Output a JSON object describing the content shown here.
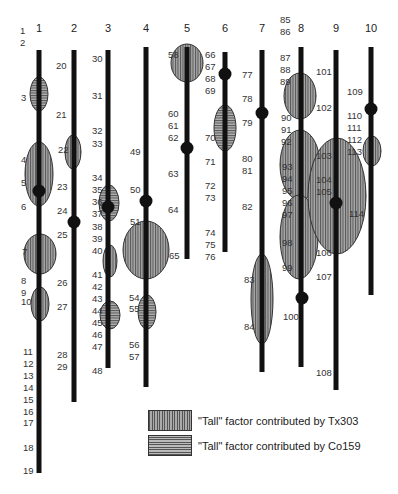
{
  "figure": {
    "type": "genetic-linkage-map",
    "colors": {
      "chromosome": "#111111",
      "ellipse_fill": "#9a9a9a",
      "tx303_stripe": "#555555",
      "co159_stripe": "#555555"
    }
  },
  "chromosomes": [
    {
      "id": "1",
      "x": 39,
      "top": 50,
      "bottom": 473,
      "markers": [
        {
          "label": "1",
          "x": 20,
          "y": 31
        },
        {
          "label": "2",
          "x": 20,
          "y": 43
        },
        {
          "label": "3",
          "x": 21,
          "y": 98
        },
        {
          "label": "4",
          "x": 21,
          "y": 160
        },
        {
          "label": "5",
          "x": 21,
          "y": 183
        },
        {
          "label": "6",
          "x": 21,
          "y": 207
        },
        {
          "label": "7",
          "x": 22,
          "y": 252
        },
        {
          "label": "8",
          "x": 21,
          "y": 281
        },
        {
          "label": "9",
          "x": 21,
          "y": 293
        },
        {
          "label": "10",
          "x": 21,
          "y": 302
        },
        {
          "label": "11",
          "x": 23,
          "y": 352
        },
        {
          "label": "12",
          "x": 23,
          "y": 364
        },
        {
          "label": "13",
          "x": 23,
          "y": 376
        },
        {
          "label": "14",
          "x": 23,
          "y": 388
        },
        {
          "label": "15",
          "x": 23,
          "y": 400
        },
        {
          "label": "16",
          "x": 23,
          "y": 412
        },
        {
          "label": "17",
          "x": 23,
          "y": 423
        },
        {
          "label": "18",
          "x": 23,
          "y": 448
        },
        {
          "label": "19",
          "x": 23,
          "y": 471
        }
      ],
      "qtls": [
        {
          "cx": 39,
          "cy": 94,
          "rx": 9,
          "ry": 17,
          "factor": "Co159"
        },
        {
          "cx": 39,
          "cy": 174,
          "rx": 14,
          "ry": 32,
          "factor": "Tx303"
        },
        {
          "cx": 40,
          "cy": 254,
          "rx": 16,
          "ry": 20,
          "factor": "Tx303"
        },
        {
          "cx": 40,
          "cy": 304,
          "rx": 9,
          "ry": 17,
          "factor": "Tx303"
        }
      ],
      "dots": [
        {
          "cx": 39,
          "cy": 191
        }
      ]
    },
    {
      "id": "2",
      "x": 74,
      "top": 50,
      "bottom": 402,
      "markers": [
        {
          "label": "20",
          "x": 56,
          "y": 66
        },
        {
          "label": "21",
          "x": 56,
          "y": 115
        },
        {
          "label": "22",
          "x": 58,
          "y": 150
        },
        {
          "label": "23",
          "x": 57,
          "y": 187
        },
        {
          "label": "24",
          "x": 57,
          "y": 211
        },
        {
          "label": "25",
          "x": 57,
          "y": 235
        },
        {
          "label": "26",
          "x": 57,
          "y": 283
        },
        {
          "label": "27",
          "x": 57,
          "y": 307
        },
        {
          "label": "28",
          "x": 57,
          "y": 355
        },
        {
          "label": "29",
          "x": 57,
          "y": 367
        }
      ],
      "qtls": [
        {
          "cx": 73,
          "cy": 152,
          "rx": 8,
          "ry": 17,
          "factor": "Tx303"
        }
      ],
      "dots": [
        {
          "cx": 74,
          "cy": 222
        }
      ]
    },
    {
      "id": "3",
      "x": 108,
      "top": 50,
      "bottom": 368,
      "markers": [
        {
          "label": "30",
          "x": 92,
          "y": 59
        },
        {
          "label": "31",
          "x": 92,
          "y": 96
        },
        {
          "label": "32",
          "x": 92,
          "y": 131
        },
        {
          "label": "33",
          "x": 92,
          "y": 144
        },
        {
          "label": "34",
          "x": 92,
          "y": 178
        },
        {
          "label": "35",
          "x": 92,
          "y": 190
        },
        {
          "label": "36",
          "x": 92,
          "y": 202
        },
        {
          "label": "37",
          "x": 92,
          "y": 214
        },
        {
          "label": "38",
          "x": 92,
          "y": 227
        },
        {
          "label": "39",
          "x": 92,
          "y": 239
        },
        {
          "label": "40",
          "x": 92,
          "y": 251
        },
        {
          "label": "41",
          "x": 92,
          "y": 275
        },
        {
          "label": "42",
          "x": 92,
          "y": 287
        },
        {
          "label": "43",
          "x": 92,
          "y": 299
        },
        {
          "label": "44",
          "x": 92,
          "y": 311
        },
        {
          "label": "45",
          "x": 92,
          "y": 323
        },
        {
          "label": "46",
          "x": 92,
          "y": 335
        },
        {
          "label": "47",
          "x": 92,
          "y": 347
        },
        {
          "label": "48",
          "x": 92,
          "y": 371
        }
      ],
      "qtls": [
        {
          "cx": 109,
          "cy": 203,
          "rx": 10,
          "ry": 18,
          "factor": "Co159"
        },
        {
          "cx": 110,
          "cy": 261,
          "rx": 7,
          "ry": 16,
          "factor": "Tx303"
        },
        {
          "cx": 110,
          "cy": 315,
          "rx": 10,
          "ry": 14,
          "factor": "Co159"
        }
      ],
      "dots": [
        {
          "cx": 108,
          "cy": 207
        }
      ]
    },
    {
      "id": "4",
      "x": 146,
      "top": 47,
      "bottom": 387,
      "markers": [
        {
          "label": "49",
          "x": 130,
          "y": 152
        },
        {
          "label": "50",
          "x": 130,
          "y": 190
        },
        {
          "label": "51",
          "x": 130,
          "y": 222
        },
        {
          "label": "54",
          "x": 129,
          "y": 298
        },
        {
          "label": "55",
          "x": 129,
          "y": 309
        },
        {
          "label": "56",
          "x": 129,
          "y": 345
        },
        {
          "label": "57",
          "x": 129,
          "y": 357
        }
      ],
      "qtls": [
        {
          "cx": 146,
          "cy": 250,
          "rx": 23,
          "ry": 29,
          "factor": "Tx303"
        },
        {
          "cx": 147,
          "cy": 312,
          "rx": 9,
          "ry": 17,
          "factor": "Co159"
        }
      ],
      "dots": [
        {
          "cx": 146,
          "cy": 201
        }
      ]
    },
    {
      "id": "5",
      "x": 187,
      "top": 47,
      "bottom": 259,
      "markers": [
        {
          "label": "58",
          "x": 168,
          "y": 55
        },
        {
          "label": "60",
          "x": 168,
          "y": 114
        },
        {
          "label": "61",
          "x": 168,
          "y": 126
        },
        {
          "label": "62",
          "x": 168,
          "y": 138
        },
        {
          "label": "63",
          "x": 168,
          "y": 174
        },
        {
          "label": "64",
          "x": 168,
          "y": 210
        },
        {
          "label": "65",
          "x": 169,
          "y": 256
        }
      ],
      "qtls": [
        {
          "cx": 187,
          "cy": 63,
          "rx": 16,
          "ry": 19,
          "factor": "Tx303"
        }
      ],
      "dots": [
        {
          "cx": 187,
          "cy": 148
        }
      ]
    },
    {
      "id": "6",
      "x": 225,
      "top": 52,
      "bottom": 252,
      "markers": [
        {
          "label": "66",
          "x": 205,
          "y": 55
        },
        {
          "label": "67",
          "x": 205,
          "y": 67
        },
        {
          "label": "68",
          "x": 205,
          "y": 79
        },
        {
          "label": "69",
          "x": 205,
          "y": 91
        },
        {
          "label": "70",
          "x": 205,
          "y": 138
        },
        {
          "label": "71",
          "x": 205,
          "y": 162
        },
        {
          "label": "72",
          "x": 205,
          "y": 186
        },
        {
          "label": "73",
          "x": 205,
          "y": 198
        },
        {
          "label": "74",
          "x": 205,
          "y": 233
        },
        {
          "label": "75",
          "x": 205,
          "y": 245
        },
        {
          "label": "76",
          "x": 205,
          "y": 257
        }
      ],
      "qtls": [
        {
          "cx": 225,
          "cy": 128,
          "rx": 11,
          "ry": 23,
          "factor": "Co159"
        }
      ],
      "dots": [
        {
          "cx": 225,
          "cy": 74
        }
      ]
    },
    {
      "id": "7",
      "x": 262,
      "top": 50,
      "bottom": 372,
      "markers": [
        {
          "label": "77",
          "x": 242,
          "y": 75
        },
        {
          "label": "78",
          "x": 242,
          "y": 99
        },
        {
          "label": "79",
          "x": 242,
          "y": 123
        },
        {
          "label": "80",
          "x": 242,
          "y": 159
        },
        {
          "label": "81",
          "x": 242,
          "y": 171
        },
        {
          "label": "82",
          "x": 242,
          "y": 207
        },
        {
          "label": "83",
          "x": 244,
          "y": 280
        },
        {
          "label": "84",
          "x": 244,
          "y": 327
        }
      ],
      "qtls": [
        {
          "cx": 262,
          "cy": 299,
          "rx": 11,
          "ry": 45,
          "factor": "Tx303"
        }
      ],
      "dots": [
        {
          "cx": 262,
          "cy": 113
        }
      ]
    },
    {
      "id": "8",
      "x": 301,
      "top": 47,
      "bottom": 367,
      "markers": [
        {
          "label": "85",
          "x": 280,
          "y": 20
        },
        {
          "label": "86",
          "x": 280,
          "y": 32
        },
        {
          "label": "87",
          "x": 280,
          "y": 58
        },
        {
          "label": "88",
          "x": 280,
          "y": 70
        },
        {
          "label": "89",
          "x": 280,
          "y": 82
        },
        {
          "label": "90",
          "x": 281,
          "y": 118
        },
        {
          "label": "91",
          "x": 281,
          "y": 130
        },
        {
          "label": "92",
          "x": 281,
          "y": 142
        },
        {
          "label": "93",
          "x": 282,
          "y": 167
        },
        {
          "label": "94",
          "x": 282,
          "y": 179
        },
        {
          "label": "95",
          "x": 282,
          "y": 191
        },
        {
          "label": "96",
          "x": 282,
          "y": 203
        },
        {
          "label": "97",
          "x": 282,
          "y": 215
        },
        {
          "label": "98",
          "x": 282,
          "y": 243
        },
        {
          "label": "99",
          "x": 282,
          "y": 268
        },
        {
          "label": "100",
          "x": 283,
          "y": 317
        }
      ],
      "qtls": [
        {
          "cx": 300,
          "cy": 96,
          "rx": 16,
          "ry": 23,
          "factor": "Tx303"
        },
        {
          "cx": 300,
          "cy": 165,
          "rx": 20,
          "ry": 35,
          "factor": "Tx303"
        },
        {
          "cx": 299,
          "cy": 237,
          "rx": 19,
          "ry": 42,
          "factor": "Tx303"
        }
      ],
      "dots": [
        {
          "cx": 302,
          "cy": 298
        }
      ]
    },
    {
      "id": "9",
      "x": 336,
      "top": 50,
      "bottom": 390,
      "markers": [
        {
          "label": "101",
          "x": 316,
          "y": 72
        },
        {
          "label": "102",
          "x": 316,
          "y": 108
        },
        {
          "label": "103",
          "x": 316,
          "y": 156
        },
        {
          "label": "104",
          "x": 316,
          "y": 180
        },
        {
          "label": "105",
          "x": 316,
          "y": 192
        },
        {
          "label": "106",
          "x": 316,
          "y": 253
        },
        {
          "label": "107",
          "x": 316,
          "y": 277
        },
        {
          "label": "108",
          "x": 316,
          "y": 373
        }
      ],
      "qtls": [
        {
          "cx": 337,
          "cy": 196,
          "rx": 29,
          "ry": 58,
          "factor": "Tx303"
        }
      ],
      "dots": [
        {
          "cx": 336,
          "cy": 203
        }
      ]
    },
    {
      "id": "10",
      "x": 371,
      "top": 47,
      "bottom": 295,
      "markers": [
        {
          "label": "109",
          "x": 347,
          "y": 92
        },
        {
          "label": "110",
          "x": 347,
          "y": 116
        },
        {
          "label": "111",
          "x": 347,
          "y": 128
        },
        {
          "label": "112",
          "x": 347,
          "y": 140
        },
        {
          "label": "113",
          "x": 347,
          "y": 152
        },
        {
          "label": "114",
          "x": 349,
          "y": 214
        }
      ],
      "qtls": [
        {
          "cx": 372,
          "cy": 151,
          "rx": 9,
          "ry": 15,
          "factor": "Tx303"
        }
      ],
      "dots": [
        {
          "cx": 371,
          "cy": 109
        }
      ]
    }
  ],
  "legend": {
    "items": [
      {
        "pattern": "vertical-stripes",
        "label": "\"Tall\" factor contributed by Tx303"
      },
      {
        "pattern": "horizontal-stripes",
        "label": "\"Tall\" factor contributed by Co159"
      }
    ]
  }
}
